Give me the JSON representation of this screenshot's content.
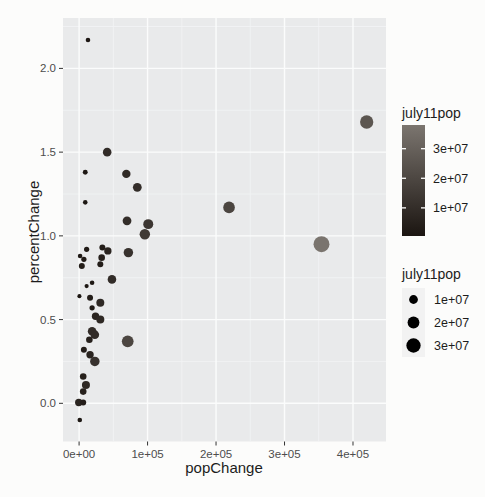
{
  "chart_data": {
    "type": "scatter",
    "title": "",
    "xlabel": "popChange",
    "ylabel": "percentChange",
    "xlim": [
      -23500,
      448200
    ],
    "ylim": [
      -0.228,
      2.301
    ],
    "x_ticks": {
      "values": [
        0,
        100000,
        200000,
        300000,
        400000
      ],
      "labels": [
        "0e+00",
        "1e+05",
        "2e+05",
        "3e+05",
        "4e+05"
      ]
    },
    "y_ticks": {
      "values": [
        0,
        0.5,
        1,
        1.5,
        2
      ],
      "labels": [
        "0.0",
        "0.5",
        "1.0",
        "1.5",
        "2.0"
      ]
    },
    "x_minor_ticks": [
      50000,
      150000,
      250000,
      350000
    ],
    "y_minor_ticks": [
      0.25,
      0.75,
      1.25,
      1.75,
      2.25
    ],
    "grid": "on",
    "legend_position": "right",
    "color_scale": {
      "low": "#1b1511",
      "high": "#7b756f",
      "domain": [
        500000,
        38000000
      ]
    },
    "size_scale": {
      "radius_range_px": [
        2,
        8
      ],
      "domain": [
        500000,
        38000000
      ]
    },
    "columns": [
      "popChange",
      "percentChange",
      "july11pop"
    ],
    "points": [
      [
        13000,
        2.17,
        1300000
      ],
      [
        41000,
        1.5,
        9500000
      ],
      [
        9000,
        1.38,
        1800000
      ],
      [
        69000,
        1.37,
        9000000
      ],
      [
        85000,
        1.29,
        10000000
      ],
      [
        9000,
        1.2,
        1300000
      ],
      [
        70000,
        1.09,
        10000000
      ],
      [
        101000,
        1.07,
        13500000
      ],
      [
        96000,
        1.01,
        15000000
      ],
      [
        72000,
        0.9,
        12000000
      ],
      [
        219000,
        1.17,
        19100000
      ],
      [
        420000,
        1.68,
        25700000
      ],
      [
        354000,
        0.95,
        37700000
      ],
      [
        71000,
        0.37,
        19500000
      ],
      [
        11000,
        0.92,
        2300000
      ],
      [
        1500,
        0.88,
        1300000
      ],
      [
        7000,
        0.86,
        2300000
      ],
      [
        4000,
        0.82,
        3600000
      ],
      [
        34000,
        0.93,
        3600000
      ],
      [
        42000,
        0.91,
        6500000
      ],
      [
        33000,
        0.87,
        4800000
      ],
      [
        31000,
        0.83,
        3600000
      ],
      [
        48000,
        0.74,
        9500000
      ],
      [
        19000,
        0.72,
        1300000
      ],
      [
        11000,
        0.7,
        700000
      ],
      [
        500,
        0.64,
        600000
      ],
      [
        16000,
        0.63,
        3600000
      ],
      [
        31000,
        0.6,
        8000000
      ],
      [
        19000,
        0.57,
        2300000
      ],
      [
        24000,
        0.52,
        6500000
      ],
      [
        31000,
        0.5,
        8000000
      ],
      [
        19000,
        0.43,
        9500000
      ],
      [
        23000,
        0.41,
        9500000
      ],
      [
        15000,
        0.38,
        4800000
      ],
      [
        7000,
        0.32,
        3600000
      ],
      [
        16000,
        0.29,
        6500000
      ],
      [
        23000,
        0.25,
        12000000
      ],
      [
        6000,
        0.16,
        4800000
      ],
      [
        10000,
        0.11,
        8000000
      ],
      [
        6000,
        0.07,
        4800000
      ],
      [
        -500,
        0.005,
        6500000
      ],
      [
        6000,
        0.005,
        3600000
      ],
      [
        1000,
        -0.1,
        1300000
      ]
    ]
  },
  "legends": {
    "color": {
      "title": "july11pop",
      "tick_values": [
        30000000,
        20000000,
        10000000
      ],
      "tick_labels": [
        "3e+07",
        "2e+07",
        "1e+07"
      ]
    },
    "size": {
      "title": "july11pop",
      "tick_values": [
        10000000,
        20000000,
        30000000
      ],
      "tick_labels": [
        "1e+07",
        "2e+07",
        "3e+07"
      ]
    }
  },
  "theme": {
    "background": "#fcfcfb",
    "panel_fill": "#e9eaeb",
    "grid_major": "#fbfcfc",
    "grid_minor": "#f2f3f4",
    "tick_mark_color": "#333333",
    "tick_label_color": "#4d4d4d",
    "title_color": "#1c1c1c",
    "legend_key_fill": "#f2f2f2"
  }
}
